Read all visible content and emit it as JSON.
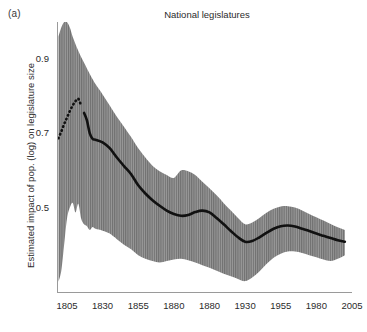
{
  "panel": {
    "label": "(a)"
  },
  "chart_data": {
    "type": "line",
    "title": "National legislatures",
    "xlabel": "",
    "ylabel": "Estimated impact of pop. (log) on legislature size",
    "xlim": [
      1798,
      2005
    ],
    "ylim": [
      0.27,
      1.0
    ],
    "grid": false,
    "legend": "none",
    "xticks": [
      1805,
      1830,
      1855,
      1880,
      1880,
      1930,
      1955,
      1980,
      2005
    ],
    "xtick_labels": [
      "1805",
      "1830",
      "1855",
      "1880",
      "1880",
      "1930",
      "1955",
      "1980",
      "2005"
    ],
    "xtick_positions": [
      1805,
      1830,
      1855,
      1880,
      1905,
      1930,
      1955,
      1980,
      2005
    ],
    "yticks": [
      0.5,
      0.7,
      0.9
    ],
    "ytick_labels": [
      "0.5",
      "0.7",
      "0.9"
    ],
    "colors": {
      "line": "#111111",
      "band_fill": "#8e8e8e",
      "band_hatch": "#6d6d6d",
      "axis": "#9a9a9a",
      "text": "#2b2b2b"
    },
    "series": [
      {
        "name": "Estimated impact of population (log) on legislature size",
        "style": "solid-with-dotted-head",
        "dotted_until_year": 1816,
        "x": [
          1799,
          1801,
          1803,
          1805,
          1807,
          1809,
          1811,
          1813,
          1815,
          1817,
          1819,
          1821,
          1823,
          1825,
          1830,
          1835,
          1840,
          1845,
          1850,
          1855,
          1860,
          1865,
          1870,
          1875,
          1880,
          1885,
          1890,
          1895,
          1900,
          1905,
          1910,
          1915,
          1920,
          1925,
          1930,
          1935,
          1940,
          1945,
          1950,
          1955,
          1960,
          1965,
          1970,
          1975,
          1980,
          1985,
          1990,
          1995,
          2000
        ],
        "y": [
          0.687,
          0.705,
          0.725,
          0.742,
          0.76,
          0.775,
          0.787,
          0.793,
          0.773,
          0.755,
          0.735,
          0.7,
          0.685,
          0.683,
          0.676,
          0.66,
          0.635,
          0.612,
          0.59,
          0.56,
          0.538,
          0.52,
          0.505,
          0.492,
          0.483,
          0.478,
          0.48,
          0.488,
          0.492,
          0.487,
          0.472,
          0.455,
          0.437,
          0.42,
          0.408,
          0.41,
          0.42,
          0.432,
          0.443,
          0.45,
          0.452,
          0.449,
          0.443,
          0.437,
          0.43,
          0.424,
          0.418,
          0.412,
          0.408
        ]
      }
    ],
    "confidence_band": {
      "name": "Confidence interval",
      "x": [
        1799,
        1801,
        1803,
        1805,
        1807,
        1809,
        1811,
        1813,
        1815,
        1817,
        1819,
        1821,
        1823,
        1825,
        1830,
        1835,
        1840,
        1845,
        1850,
        1855,
        1860,
        1865,
        1870,
        1875,
        1880,
        1885,
        1890,
        1895,
        1900,
        1905,
        1910,
        1915,
        1920,
        1925,
        1930,
        1935,
        1940,
        1945,
        1950,
        1955,
        1960,
        1965,
        1970,
        1975,
        1980,
        1985,
        1990,
        1995,
        2000
      ],
      "upper": [
        0.96,
        0.985,
        1.0,
        1.0,
        0.985,
        0.96,
        0.94,
        0.922,
        0.905,
        0.89,
        0.875,
        0.86,
        0.846,
        0.833,
        0.805,
        0.775,
        0.745,
        0.718,
        0.69,
        0.66,
        0.635,
        0.613,
        0.598,
        0.588,
        0.58,
        0.6,
        0.598,
        0.588,
        0.57,
        0.552,
        0.533,
        0.512,
        0.492,
        0.472,
        0.455,
        0.46,
        0.472,
        0.486,
        0.497,
        0.503,
        0.504,
        0.5,
        0.492,
        0.483,
        0.474,
        0.465,
        0.456,
        0.447,
        0.44
      ],
      "lower": [
        0.3,
        0.33,
        0.4,
        0.47,
        0.5,
        0.513,
        0.487,
        0.51,
        0.47,
        0.455,
        0.45,
        0.44,
        0.448,
        0.443,
        0.438,
        0.43,
        0.415,
        0.4,
        0.388,
        0.372,
        0.362,
        0.356,
        0.352,
        0.356,
        0.36,
        0.362,
        0.358,
        0.352,
        0.345,
        0.338,
        0.33,
        0.322,
        0.315,
        0.308,
        0.302,
        0.312,
        0.328,
        0.348,
        0.365,
        0.376,
        0.382,
        0.382,
        0.378,
        0.372,
        0.366,
        0.36,
        0.356,
        0.362,
        0.372
      ]
    }
  }
}
